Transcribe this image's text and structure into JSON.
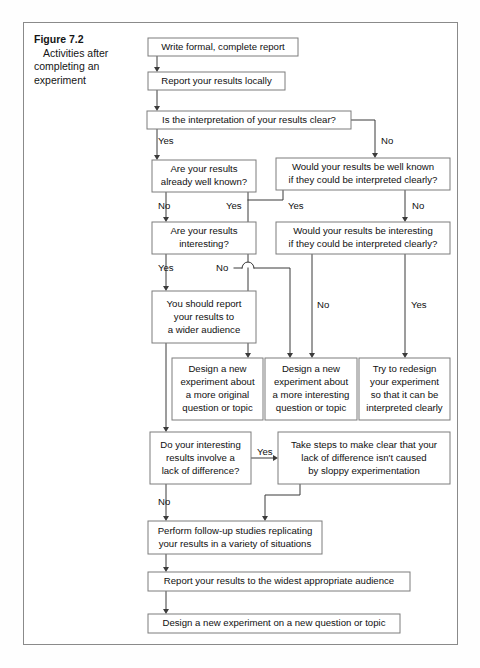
{
  "figure": {
    "caption_title": "Figure 7.2",
    "caption_body": "Activities after completing an experiment"
  },
  "chart_data": {
    "type": "diagram",
    "subtype": "flowchart",
    "title": "Figure 7.2 Activities after completing an experiment",
    "orientation": "top-to-bottom",
    "nodes": [
      {
        "id": "n1",
        "label": "Write formal, complete report",
        "lines": [
          "Write formal, complete report"
        ],
        "shape": "process",
        "x": 148,
        "y": 38,
        "w": 150,
        "h": 18
      },
      {
        "id": "n2",
        "label": "Report your results locally",
        "lines": [
          "Report your results locally"
        ],
        "shape": "process",
        "x": 148,
        "y": 72,
        "w": 137,
        "h": 18
      },
      {
        "id": "n3",
        "label": "Is the interpretation of your results clear?",
        "lines": [
          "Is the interpretation of your results clear?"
        ],
        "shape": "decision",
        "x": 147,
        "y": 111,
        "w": 204,
        "h": 18
      },
      {
        "id": "n4",
        "label": "Are your results already well known?",
        "lines": [
          "Are your results",
          "already well known?"
        ],
        "shape": "decision",
        "x": 152,
        "y": 160,
        "w": 104,
        "h": 32
      },
      {
        "id": "n5",
        "label": "Would your results be well known if they could be interpreted clearly?",
        "lines": [
          "Would your results be well known",
          "if they could be interpreted clearly?"
        ],
        "shape": "decision",
        "x": 276,
        "y": 158,
        "w": 174,
        "h": 32
      },
      {
        "id": "n6",
        "label": "Are your results interesting?",
        "lines": [
          "Are your results",
          "interesting?"
        ],
        "shape": "decision",
        "x": 152,
        "y": 222,
        "w": 104,
        "h": 32
      },
      {
        "id": "n7",
        "label": "Would your results be interesting if they could be interpreted clearly?",
        "lines": [
          "Would your results be interesting",
          "if they could be interpreted clearly?"
        ],
        "shape": "decision",
        "x": 276,
        "y": 222,
        "w": 174,
        "h": 32
      },
      {
        "id": "n8",
        "label": "You should report your results to a wider audience",
        "lines": [
          "You should report",
          "your results to",
          "a wider audience"
        ],
        "shape": "process",
        "x": 152,
        "y": 291,
        "w": 104,
        "h": 52
      },
      {
        "id": "n9",
        "label": "Design a new experiment about a more original question or topic",
        "lines": [
          "Design a new",
          "experiment about",
          "a more original",
          "question or topic"
        ],
        "shape": "process",
        "x": 172,
        "y": 358,
        "w": 91,
        "h": 62
      },
      {
        "id": "n10",
        "label": "Design a new experiment about a more interesting question or topic",
        "lines": [
          "Design a new",
          "experiment about",
          "a more interesting",
          "question or topic"
        ],
        "shape": "process",
        "x": 265,
        "y": 358,
        "w": 92,
        "h": 62
      },
      {
        "id": "n11",
        "label": "Try to redesign your experiment so that it can be interpreted clearly",
        "lines": [
          "Try to redesign",
          "your experiment",
          "so that it can be",
          "interpreted clearly"
        ],
        "shape": "process",
        "x": 359,
        "y": 358,
        "w": 91,
        "h": 62
      },
      {
        "id": "n12",
        "label": "Do your interesting results involve a lack of difference?",
        "lines": [
          "Do your interesting",
          "results involve a",
          "lack of difference?"
        ],
        "shape": "decision",
        "x": 150,
        "y": 432,
        "w": 101,
        "h": 52
      },
      {
        "id": "n13",
        "label": "Take steps to make clear that your lack of difference isn't caused by sloppy experimentation",
        "lines": [
          "Take steps to make clear that your",
          "lack of difference isn't caused",
          "by sloppy experimentation"
        ],
        "shape": "process",
        "x": 278,
        "y": 432,
        "w": 172,
        "h": 52
      },
      {
        "id": "n14",
        "label": "Perform follow-up studies replicating your results in a variety of situations",
        "lines": [
          "Perform follow-up studies replicating",
          "your results in a variety of situations"
        ],
        "shape": "process",
        "x": 148,
        "y": 521,
        "w": 174,
        "h": 33
      },
      {
        "id": "n15",
        "label": "Report your results to the widest appropriate audience",
        "lines": [
          "Report your results to the widest appropriate audience"
        ],
        "shape": "process",
        "x": 148,
        "y": 572,
        "w": 262,
        "h": 19
      },
      {
        "id": "n16",
        "label": "Design a new experiment on a new question or topic",
        "lines": [
          "Design a new experiment on a new question or topic"
        ],
        "shape": "process",
        "x": 148,
        "y": 614,
        "w": 252,
        "h": 19
      }
    ],
    "edges": [
      {
        "from": "n1",
        "to": "n2",
        "label": ""
      },
      {
        "from": "n2",
        "to": "n3",
        "label": ""
      },
      {
        "from": "n3",
        "to": "n4",
        "label": "Yes"
      },
      {
        "from": "n3",
        "to": "n5",
        "label": "No"
      },
      {
        "from": "n4",
        "to": "n6",
        "label": "No"
      },
      {
        "from": "n4",
        "to": "n9",
        "label": "Yes"
      },
      {
        "from": "n5",
        "to": "n9",
        "label": "Yes"
      },
      {
        "from": "n5",
        "to": "n7",
        "label": "No"
      },
      {
        "from": "n6",
        "to": "n8",
        "label": "Yes"
      },
      {
        "from": "n6",
        "to": "n10",
        "label": "No"
      },
      {
        "from": "n7",
        "to": "n10",
        "label": "No"
      },
      {
        "from": "n7",
        "to": "n11",
        "label": "Yes"
      },
      {
        "from": "n8",
        "to": "n12",
        "label": ""
      },
      {
        "from": "n12",
        "to": "n13",
        "label": "Yes"
      },
      {
        "from": "n12",
        "to": "n14",
        "label": "No"
      },
      {
        "from": "n13",
        "to": "n14",
        "label": ""
      },
      {
        "from": "n14",
        "to": "n15",
        "label": ""
      },
      {
        "from": "n15",
        "to": "n16",
        "label": ""
      }
    ],
    "edge_labels": [
      {
        "text": "Yes",
        "x": 158,
        "y": 141
      },
      {
        "text": "No",
        "x": 381,
        "y": 141
      },
      {
        "text": "No",
        "x": 158,
        "y": 206
      },
      {
        "text": "Yes",
        "x": 226,
        "y": 206
      },
      {
        "text": "Yes",
        "x": 288,
        "y": 206
      },
      {
        "text": "No",
        "x": 412,
        "y": 206
      },
      {
        "text": "Yes",
        "x": 158,
        "y": 268
      },
      {
        "text": "No",
        "x": 216,
        "y": 268
      },
      {
        "text": "No",
        "x": 317,
        "y": 305
      },
      {
        "text": "Yes",
        "x": 411,
        "y": 305
      },
      {
        "text": "Yes",
        "x": 257,
        "y": 452
      },
      {
        "text": "No",
        "x": 158,
        "y": 502
      }
    ]
  },
  "colors": {
    "frame_border": "#8a8a8a",
    "box_border": "#7d7d7d",
    "line": "#3b3b3b",
    "text": "#101010",
    "page_bg": "#ffffff"
  }
}
